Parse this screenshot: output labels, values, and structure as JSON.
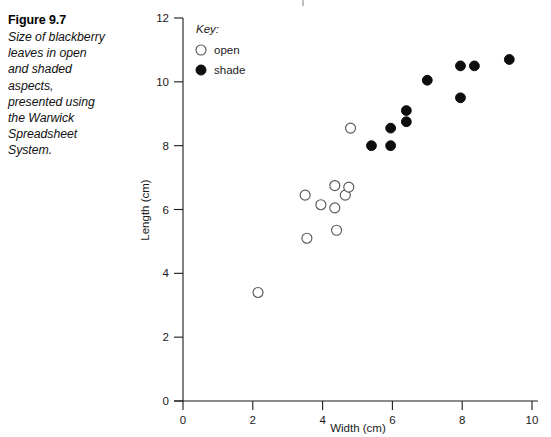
{
  "caption": {
    "title": "Figure 9.7",
    "body": "Size of blackberry\nleaves in open\nand shaded\naspects,\npresented using\nthe Warwick\nSpreadsheet\nSystem."
  },
  "legend": {
    "title": "Key:",
    "entries": [
      {
        "label": "open",
        "marker": "open-circle"
      },
      {
        "label": "shade",
        "marker": "filled-circle"
      }
    ]
  },
  "axes": {
    "x_title": "Width (cm)",
    "y_title": "Length (cm)",
    "x_ticks": [
      "0",
      "2",
      "4",
      "6",
      "8",
      "10"
    ],
    "y_ticks": [
      "0",
      "2",
      "4",
      "6",
      "8",
      "10",
      "12"
    ]
  },
  "colors": {
    "open_stroke": "#555a5e",
    "open_fill": "#ffffff",
    "shade_fill": "#0d0d0d",
    "axis": "#1a1a1a",
    "background": "#ffffff"
  },
  "chart_data": {
    "type": "scatter",
    "title": "Size of blackberry leaves in open and shaded aspects, presented using the Warwick Spreadsheet System.",
    "xlabel": "Width (cm)",
    "ylabel": "Length (cm)",
    "xlim": [
      0,
      10
    ],
    "ylim": [
      0,
      12
    ],
    "xticks": [
      0,
      2,
      4,
      6,
      8,
      10
    ],
    "yticks": [
      0,
      2,
      4,
      6,
      8,
      10,
      12
    ],
    "grid": false,
    "legend_position": "top-left-inside",
    "series": [
      {
        "name": "open",
        "marker": "open-circle",
        "points": [
          [
            2.15,
            3.4
          ],
          [
            3.5,
            6.45
          ],
          [
            3.55,
            5.1
          ],
          [
            3.95,
            6.15
          ],
          [
            4.35,
            6.75
          ],
          [
            4.35,
            6.05
          ],
          [
            4.4,
            5.35
          ],
          [
            4.65,
            6.45
          ],
          [
            4.75,
            6.7
          ],
          [
            4.8,
            8.55
          ]
        ]
      },
      {
        "name": "shade",
        "marker": "filled-circle",
        "points": [
          [
            5.4,
            8.0
          ],
          [
            5.95,
            8.0
          ],
          [
            5.95,
            8.55
          ],
          [
            6.4,
            9.1
          ],
          [
            6.4,
            8.75
          ],
          [
            7.0,
            10.05
          ],
          [
            7.95,
            10.5
          ],
          [
            7.95,
            9.5
          ],
          [
            8.35,
            10.5
          ],
          [
            9.35,
            10.7
          ]
        ]
      }
    ]
  }
}
